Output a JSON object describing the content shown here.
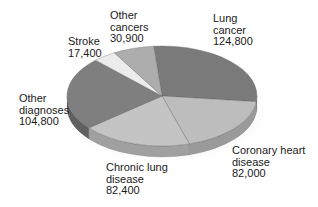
{
  "chart_data": {
    "type": "pie",
    "style": "3d",
    "title": "",
    "total": 442300,
    "slices": [
      {
        "label": "Lung cancer",
        "label_lines": [
          "Lung",
          "cancer"
        ],
        "value": 124800,
        "value_text": "124,800",
        "color": "#7a7a7a",
        "side_color": "#5e5e5e"
      },
      {
        "label": "Coronary heart disease",
        "label_lines": [
          "Coronary heart",
          "disease"
        ],
        "value": 82000,
        "value_text": "82,000",
        "color": "#bdbdbd",
        "side_color": "#9a9a9a"
      },
      {
        "label": "Chronic lung disease",
        "label_lines": [
          "Chronic lung",
          "disease"
        ],
        "value": 82400,
        "value_text": "82,400",
        "color": "#c4c4c4",
        "side_color": "#a0a0a0"
      },
      {
        "label": "Other diagnoses",
        "label_lines": [
          "Other",
          "diagnoses"
        ],
        "value": 104800,
        "value_text": "104,800",
        "color": "#7f7f7f",
        "side_color": "#606060"
      },
      {
        "label": "Stroke",
        "label_lines": [
          "Stroke"
        ],
        "value": 17400,
        "value_text": "17,400",
        "color": "#ececec",
        "side_color": "#c8c8c8"
      },
      {
        "label": "Other cancers",
        "label_lines": [
          "Other",
          "cancers"
        ],
        "value": 30900,
        "value_text": "30,900",
        "color": "#adadad",
        "side_color": "#8c8c8c"
      }
    ],
    "legend": "none (direct labels)"
  }
}
